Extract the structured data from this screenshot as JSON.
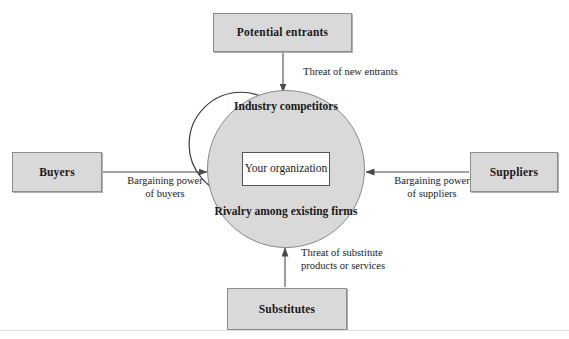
{
  "diagram": {
    "colors": {
      "node_fill": "#d9d9d9",
      "node_border": "#8c8c8c",
      "circle_fill": "#d9d9d9",
      "circle_border": "#8a8a8a",
      "inner_box_fill": "#ffffff",
      "inner_box_border": "#555555",
      "arrow_stroke": "#4a4a4a",
      "text": "#1a1a1a",
      "background": "#ffffff"
    },
    "nodes": {
      "potential_entrants": "Potential entrants",
      "buyers": "Buyers",
      "suppliers": "Suppliers",
      "substitutes": "Substitutes",
      "your_organization": "Your\norganization"
    },
    "center": {
      "top_label": "Industry\ncompetitors",
      "bottom_label": "Rivalry among\nexisting firms"
    },
    "edges": {
      "threat_of_new_entrants": "Threat of new entrants",
      "bargaining_power_of_buyers": "Bargaining power\nof buyers",
      "bargaining_power_of_suppliers": "Bargaining power\nof suppliers",
      "threat_of_substitutes": "Threat of substitute\nproducts or services"
    }
  }
}
